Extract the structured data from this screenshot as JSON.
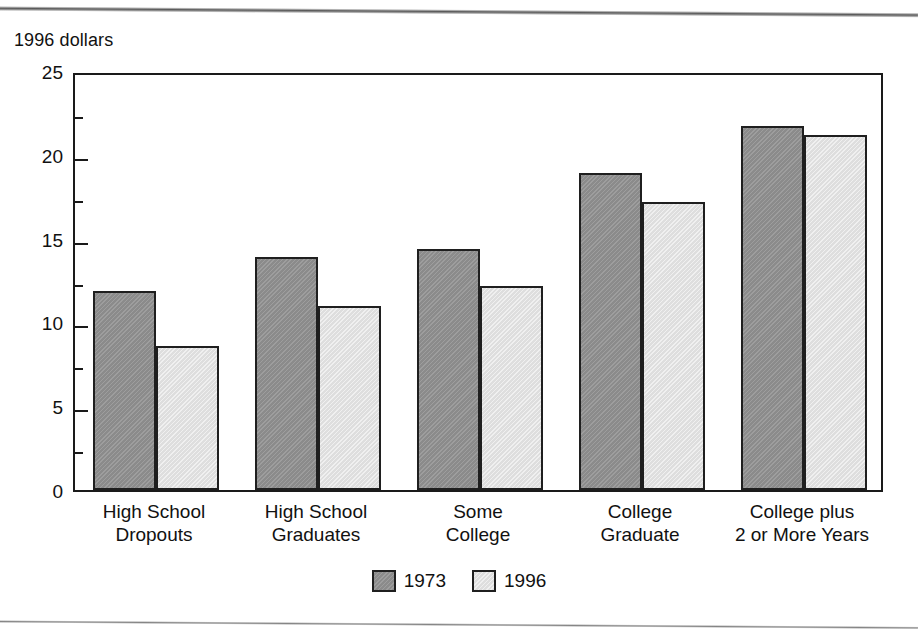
{
  "figure": {
    "axis_unit_label": "1996 dollars"
  },
  "chart_data": {
    "type": "bar",
    "title": "",
    "subtitle": "",
    "xlabel": "",
    "ylabel": "1996 dollars",
    "ylim": [
      0,
      25
    ],
    "yticks": [
      0,
      5,
      10,
      15,
      20,
      25
    ],
    "ytick_labels": [
      "0",
      "5",
      "10",
      "15",
      "20",
      "25"
    ],
    "minor_ytick_interval": 2.5,
    "grid": false,
    "legend_position": "bottom-center",
    "categories": [
      "High School\nDropouts",
      "High School\nGraduates",
      "Some\nCollege",
      "College\nGraduate",
      "College plus\n2 or More Years"
    ],
    "series": [
      {
        "name": "1973",
        "color": "#8b8b8b",
        "values": [
          11.9,
          13.9,
          14.4,
          18.9,
          21.7
        ]
      },
      {
        "name": "1996",
        "color": "#dedede",
        "values": [
          8.6,
          11.0,
          12.2,
          17.2,
          21.2
        ]
      }
    ]
  },
  "legend": {
    "entries": [
      {
        "label": "1973",
        "swatch": "dark-gray"
      },
      {
        "label": "1996",
        "swatch": "light-gray"
      }
    ]
  }
}
